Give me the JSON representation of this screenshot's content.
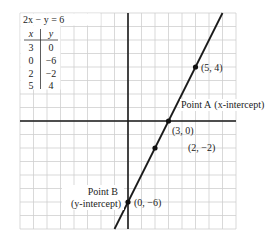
{
  "equation": "2x − y = 6",
  "table": {
    "headers": [
      "x",
      "y"
    ],
    "rows": [
      [
        "3",
        "0"
      ],
      [
        "0",
        "−6"
      ],
      [
        "2",
        "−2"
      ],
      [
        "5",
        "4"
      ]
    ]
  },
  "points": [
    {
      "id": "point-5-4",
      "x": 5,
      "y": 4,
      "label": "(5, 4)"
    },
    {
      "id": "point-3-0",
      "x": 3,
      "y": 0,
      "label": "(3, 0)"
    },
    {
      "id": "point-2-neg2",
      "x": 2,
      "y": -2,
      "label": "(2, −2)"
    },
    {
      "id": "point-0-neg6",
      "x": 0,
      "y": -6,
      "label": "(0, −6)"
    }
  ],
  "annotations": {
    "point_a": {
      "name": "Point A",
      "desc": "(x-intercept)"
    },
    "point_b": {
      "name": "Point B",
      "desc": "(y-intercept)"
    }
  },
  "grid": {
    "xmin": -8,
    "xmax": 8,
    "ymin": -8,
    "ymax": 8
  },
  "chart_data": {
    "type": "line",
    "title": "2x − y = 6",
    "xlabel": "",
    "ylabel": "",
    "xlim": [
      -8,
      8
    ],
    "ylim": [
      -8,
      8
    ],
    "grid": true,
    "series": [
      {
        "name": "2x − y = 6",
        "x": [
          0,
          2,
          3,
          5
        ],
        "y": [
          -6,
          -2,
          0,
          4
        ]
      }
    ],
    "annotations": [
      "Point A (x-intercept) at (3, 0)",
      "Point B (y-intercept) at (0, −6)"
    ]
  }
}
